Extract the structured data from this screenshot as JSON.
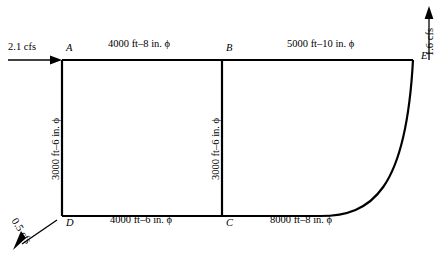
{
  "diagram": {
    "type": "pipe-network-schematic",
    "nodes": [
      {
        "id": "A",
        "label": "A",
        "x": 62,
        "y": 60
      },
      {
        "id": "B",
        "label": "B",
        "x": 222,
        "y": 60
      },
      {
        "id": "C",
        "label": "C",
        "x": 222,
        "y": 216
      },
      {
        "id": "D",
        "label": "D",
        "x": 62,
        "y": 216
      },
      {
        "id": "E",
        "label": "E",
        "x": 413,
        "y": 60
      }
    ],
    "pipes": [
      {
        "from": "A",
        "to": "B",
        "label": "4000 ft–8 in. ϕ",
        "length_ft": 4000,
        "diameter_in": 8,
        "orientation": "horizontal"
      },
      {
        "from": "B",
        "to": "E",
        "label": "5000 ft–10 in. ϕ",
        "length_ft": 5000,
        "diameter_in": 10,
        "orientation": "horizontal"
      },
      {
        "from": "A",
        "to": "D",
        "label": "3000 ft–6 in. ϕ",
        "length_ft": 3000,
        "diameter_in": 6,
        "orientation": "vertical"
      },
      {
        "from": "B",
        "to": "C",
        "label": "3000 ft–6 in. ϕ",
        "length_ft": 3000,
        "diameter_in": 6,
        "orientation": "vertical"
      },
      {
        "from": "D",
        "to": "C",
        "label": "4000 ft–6 in. ϕ",
        "length_ft": 4000,
        "diameter_in": 6,
        "orientation": "horizontal"
      },
      {
        "from": "C",
        "to": "E",
        "label": "8000 ft–8 in. ϕ",
        "length_ft": 8000,
        "diameter_in": 8,
        "orientation": "curved"
      }
    ],
    "flows": [
      {
        "id": "inflow-A",
        "label": "2.1 cfs",
        "value": 2.1,
        "unit": "cfs",
        "direction": "in",
        "at": "A"
      },
      {
        "id": "outflow-E",
        "label": "1.6 cfs",
        "value": 1.6,
        "unit": "cfs",
        "direction": "out",
        "at": "E"
      },
      {
        "id": "outflow-D",
        "label": "0.5 cfs",
        "value": 0.5,
        "unit": "cfs",
        "direction": "out",
        "at": "D"
      }
    ],
    "caption": ""
  }
}
